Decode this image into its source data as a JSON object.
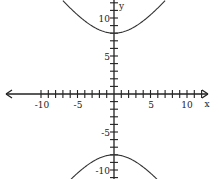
{
  "chart_data": {
    "type": "line",
    "title": "",
    "xlabel": "x",
    "ylabel": "y",
    "equation": "y^2/64 - x^2/36 = 1",
    "xlim": [
      -12.5,
      13.5
    ],
    "ylim": [
      -11.5,
      12.5
    ],
    "grid": false,
    "legend": null,
    "x_ticks": [
      -10,
      -5,
      5,
      10
    ],
    "x_tick_labels": [
      "-10",
      "-5",
      "5",
      "10"
    ],
    "y_ticks": [
      10,
      5,
      -5,
      -10
    ],
    "y_tick_labels": [
      "10",
      "5",
      "-5",
      "-10"
    ],
    "series": [
      {
        "name": "upper branch",
        "points": [
          [
            -6.6,
            11.9
          ],
          [
            -5,
            10.41
          ],
          [
            -3,
            8.94
          ],
          [
            -1,
            8.11
          ],
          [
            0,
            8
          ],
          [
            1,
            8.11
          ],
          [
            3,
            8.94
          ],
          [
            5,
            10.41
          ],
          [
            6.4,
            11.7
          ]
        ]
      },
      {
        "name": "lower branch",
        "points": [
          [
            -5.9,
            -11.2
          ],
          [
            -5,
            -10.41
          ],
          [
            -3,
            -8.94
          ],
          [
            -1,
            -8.11
          ],
          [
            0,
            -8
          ],
          [
            1,
            -8.11
          ],
          [
            3,
            -8.94
          ],
          [
            5,
            -10.41
          ],
          [
            6.2,
            -11.6
          ]
        ]
      }
    ],
    "colors": {
      "axis": "#222222",
      "curve": "#333333"
    }
  },
  "axes": {
    "x_label": "x",
    "y_label": "y",
    "x_tick_labels": [
      "-10",
      "-5",
      "5",
      "10"
    ],
    "y_tick_labels": [
      "10",
      "5",
      "-5",
      "-10"
    ]
  }
}
